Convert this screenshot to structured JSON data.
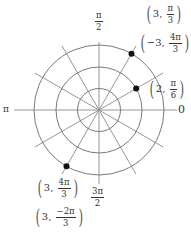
{
  "diagram": {
    "type": "polar-coordinate-grid",
    "center": {
      "x": 99,
      "y": 110
    },
    "circle_radii": [
      21.5,
      43,
      65
    ],
    "spoke_angles_deg": [
      0,
      30,
      60,
      90,
      120,
      150,
      180,
      210,
      240,
      270,
      300,
      330
    ],
    "spoke_length": 74,
    "colors": {
      "grid": "#8a8a8a",
      "point": "#111111",
      "text": "#333333"
    }
  },
  "axis_labels": {
    "top": {
      "num": "π",
      "den": "2"
    },
    "bottom": {
      "num": "3π",
      "den": "2"
    },
    "left": "π",
    "right": "0"
  },
  "points": [
    {
      "r": 3,
      "theta_deg": 60,
      "dot": {
        "x": 131.5,
        "y": 53.7
      },
      "labels": [
        {
          "r": "3",
          "theta_num": "π",
          "theta_den": "3"
        },
        {
          "r": "−3",
          "theta_num": "4π",
          "theta_den": "3"
        }
      ]
    },
    {
      "r": 2,
      "theta_deg": 30,
      "dot": {
        "x": 136.2,
        "y": 88.5
      },
      "labels": [
        {
          "r": "2",
          "theta_num": "π",
          "theta_den": "6"
        }
      ]
    },
    {
      "r": 3,
      "theta_deg": 240,
      "dot": {
        "x": 66.5,
        "y": 166.3
      },
      "labels": [
        {
          "r": "3",
          "theta_num": "4π",
          "theta_den": "3"
        },
        {
          "r": "3",
          "theta_num": "−2π",
          "theta_den": "3"
        }
      ]
    }
  ]
}
